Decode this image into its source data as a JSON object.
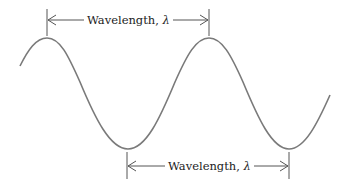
{
  "diagram": {
    "type": "wave",
    "wave_color": "#7a7a7a",
    "dimension_color": "#555555",
    "top_marker": {
      "label": "Wavelength, ",
      "symbol": "λ",
      "from": "crest",
      "to": "crest"
    },
    "bottom_marker": {
      "label": "Wavelength, ",
      "symbol": "λ",
      "from": "trough",
      "to": "trough"
    }
  }
}
